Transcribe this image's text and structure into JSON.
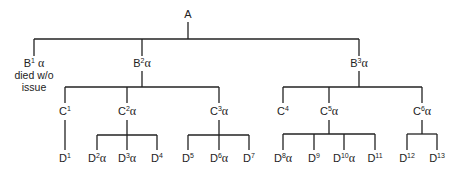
{
  "diagram": {
    "type": "family-tree",
    "root": {
      "id": "A",
      "base": "A",
      "sup": "",
      "alpha": false,
      "children": [
        {
          "id": "B1",
          "base": "B",
          "sup": "1",
          "alpha": true,
          "note": [
            "died w/o",
            "issue"
          ],
          "children": []
        },
        {
          "id": "B2",
          "base": "B",
          "sup": "2",
          "alpha": true,
          "children": [
            {
              "id": "C1",
              "base": "C",
              "sup": "1",
              "alpha": false,
              "children": [
                {
                  "id": "D1",
                  "base": "D",
                  "sup": "1",
                  "alpha": false
                }
              ]
            },
            {
              "id": "C2",
              "base": "C",
              "sup": "2",
              "alpha": true,
              "children": [
                {
                  "id": "D2",
                  "base": "D",
                  "sup": "2",
                  "alpha": true
                },
                {
                  "id": "D3",
                  "base": "D",
                  "sup": "3",
                  "alpha": true
                },
                {
                  "id": "D4",
                  "base": "D",
                  "sup": "4",
                  "alpha": false
                }
              ]
            },
            {
              "id": "C3",
              "base": "C",
              "sup": "3",
              "alpha": true,
              "children": [
                {
                  "id": "D5",
                  "base": "D",
                  "sup": "5",
                  "alpha": false
                },
                {
                  "id": "D6",
                  "base": "D",
                  "sup": "6",
                  "alpha": true
                },
                {
                  "id": "D7",
                  "base": "D",
                  "sup": "7",
                  "alpha": false
                }
              ]
            }
          ]
        },
        {
          "id": "B3",
          "base": "B",
          "sup": "3",
          "alpha": true,
          "children": [
            {
              "id": "C4",
              "base": "C",
              "sup": "4",
              "alpha": false,
              "children": []
            },
            {
              "id": "C5",
              "base": "C",
              "sup": "5",
              "alpha": true,
              "children": [
                {
                  "id": "D8",
                  "base": "D",
                  "sup": "8",
                  "alpha": true
                },
                {
                  "id": "D9",
                  "base": "D",
                  "sup": "9",
                  "alpha": false
                },
                {
                  "id": "D10",
                  "base": "D",
                  "sup": "10",
                  "alpha": true
                },
                {
                  "id": "D11",
                  "base": "D",
                  "sup": "11",
                  "alpha": false
                }
              ]
            },
            {
              "id": "C6",
              "base": "C",
              "sup": "6",
              "alpha": true,
              "children": [
                {
                  "id": "D12",
                  "base": "D",
                  "sup": "12",
                  "alpha": false
                },
                {
                  "id": "D13",
                  "base": "D",
                  "sup": "13",
                  "alpha": false
                }
              ]
            }
          ]
        }
      ]
    },
    "alpha_symbol": "α",
    "line_color": "#222222"
  },
  "labels": {
    "A": "A",
    "B1": "B",
    "B1_sup": "1",
    "B1_note_1": "died w/o",
    "B1_note_2": "issue",
    "B2": "B",
    "B2_sup": "2",
    "B3": "B",
    "B3_sup": "3",
    "C1": "C",
    "C1_sup": "1",
    "C2": "C",
    "C2_sup": "2",
    "C3": "C",
    "C3_sup": "3",
    "C4": "C",
    "C4_sup": "4",
    "C5": "C",
    "C5_sup": "5",
    "C6": "C",
    "C6_sup": "6",
    "D1": "D",
    "D1_sup": "1",
    "D2": "D",
    "D2_sup": "2",
    "D3": "D",
    "D3_sup": "3",
    "D4": "D",
    "D4_sup": "4",
    "D5": "D",
    "D5_sup": "5",
    "D6": "D",
    "D6_sup": "6",
    "D7": "D",
    "D7_sup": "7",
    "D8": "D",
    "D8_sup": "8",
    "D9": "D",
    "D9_sup": "9",
    "D10": "D",
    "D10_sup": "10",
    "D11": "D",
    "D11_sup": "11",
    "D12": "D",
    "D12_sup": "12",
    "D13": "D",
    "D13_sup": "13",
    "alpha": "α"
  }
}
